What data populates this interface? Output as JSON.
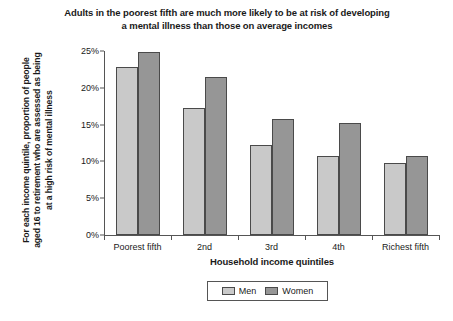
{
  "chart_data": {
    "type": "bar",
    "title": "Adults in the poorest fifth are much more likely to be at risk of developing a mental illness than those on average incomes",
    "xlabel": "Household income quintiles",
    "ylabel": "For each income quintile, proportion of people aged 16 to retirement who are assessed as being at a high risk of mental illness",
    "categories": [
      "Poorest fifth",
      "2nd",
      "3rd",
      "4th",
      "Richest fifth"
    ],
    "series": [
      {
        "name": "Men",
        "color": "#c9c9c9",
        "values": [
          22.8,
          17.2,
          12.2,
          10.7,
          9.8
        ]
      },
      {
        "name": "Women",
        "color": "#969696",
        "values": [
          24.8,
          21.5,
          15.8,
          15.2,
          10.8
        ]
      }
    ],
    "ylim": [
      0,
      25
    ],
    "yticks": [
      "0%",
      "5%",
      "10%",
      "15%",
      "20%",
      "25%"
    ],
    "ytick_values": [
      0,
      5,
      10,
      15,
      20,
      25
    ],
    "grid": false,
    "legend_position": "bottom-center"
  }
}
